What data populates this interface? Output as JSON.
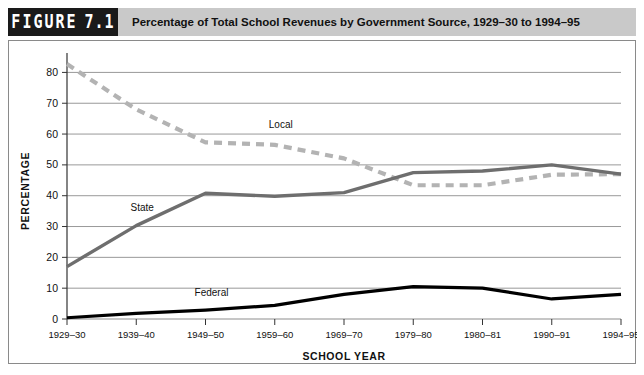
{
  "header": {
    "figure_word": "FIGURE",
    "figure_number": "7.1",
    "title": "Percentage of Total School Revenues by Government Source, 1929–30 to 1994–95",
    "tag_bg": "#1a1a1a",
    "bar_bg": "#c9c9c9"
  },
  "chart_data": {
    "type": "line",
    "title": "Percentage of Total School Revenues by Government Source, 1929–30 to 1994–95",
    "xlabel": "SCHOOL YEAR",
    "ylabel": "PERCENTAGE",
    "categories": [
      "1929–30",
      "1939–40",
      "1949–50",
      "1959–60",
      "1969–70",
      "1979–80",
      "1980–81",
      "1990–91",
      "1994–95"
    ],
    "ylim": [
      0,
      85
    ],
    "yticks": [
      0,
      10,
      20,
      30,
      40,
      50,
      60,
      70,
      80
    ],
    "grid": true,
    "legend": "inline-labels",
    "series": [
      {
        "name": "Local",
        "values": [
          82.7,
          68.0,
          57.3,
          56.5,
          52.1,
          43.4,
          43.4,
          46.8,
          47.0
        ],
        "color": "#b3b3b3",
        "style": "dashed",
        "width": 4.2,
        "label_x": "1959–60",
        "label_value": 62
      },
      {
        "name": "State",
        "values": [
          17.0,
          30.3,
          40.8,
          39.8,
          41.0,
          47.5,
          48.0,
          50.0,
          47.0
        ],
        "color": "#6e6e6e",
        "style": "solid",
        "width": 3.4,
        "label_x": "1939–40",
        "label_value": 35
      },
      {
        "name": "Federal",
        "values": [
          0.4,
          1.8,
          2.9,
          4.4,
          8.0,
          10.5,
          10.0,
          6.5,
          8.0
        ],
        "color": "#000000",
        "style": "solid",
        "width": 3.2,
        "label_x": "1949–50",
        "label_value": 7.5
      }
    ]
  }
}
